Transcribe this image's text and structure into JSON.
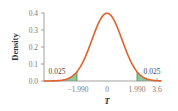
{
  "chart_data": {
    "type": "area",
    "title": "",
    "xlabel": "T",
    "ylabel": "Density",
    "distribution": "t",
    "degrees_of_freedom_approx": 100,
    "xlim": [
      -3.6,
      3.6
    ],
    "ylim": [
      0,
      0.4
    ],
    "yticks": [
      "0.0",
      "0.1",
      "0.2",
      "0.3",
      "0.4"
    ],
    "xticks": [
      "−1.990",
      "0",
      "1.990",
      "3.6"
    ],
    "critical_values": [
      -1.99,
      1.99
    ],
    "tail_areas": [
      {
        "region": "left",
        "x_range": [
          -3.6,
          -1.99
        ],
        "area": 0.025,
        "label": "0.025"
      },
      {
        "region": "right",
        "x_range": [
          1.99,
          3.6
        ],
        "area": 0.025,
        "label": "0.025"
      }
    ],
    "curve_peak": {
      "x": 0,
      "y": 0.396
    },
    "grid": false,
    "legend": "none"
  },
  "colors": {
    "curve": "#e0622a",
    "tail_fill": "#8fc79a",
    "tail_line": "#3f8a55",
    "axis": "#888888"
  },
  "labels": {
    "ylabel": "Density",
    "xlabel": "T",
    "left_tail": "0.025",
    "right_tail": "0.025",
    "y0": "0.0",
    "y1": "0.1",
    "y2": "0.2",
    "y3": "0.3",
    "y4": "0.4",
    "x_neg_crit": "−1.990",
    "x_zero": "0",
    "x_pos_crit": "1.990",
    "x_max": "3.6"
  }
}
